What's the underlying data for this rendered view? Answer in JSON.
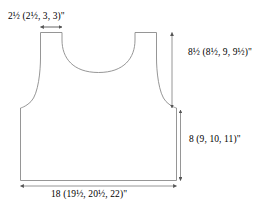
{
  "figure": {
    "type": "garment-schematic",
    "name": "Vest / tank top front piece schematic",
    "units": "inches",
    "size_convention": "smallest size first, remaining sizes in parentheses",
    "sizes": [
      "S",
      "M",
      "L",
      "XL"
    ],
    "colors": {
      "outline": "#8a8a8a",
      "dimension_line": "#8a8a8a",
      "text": "#000000",
      "background": "#ffffff"
    }
  },
  "labels": {
    "shoulder_width": {
      "id": "shoulder-width",
      "whole": "2",
      "frac_num": "1",
      "frac_den": "2",
      "parenthetical": "(2½, 3, 3)\"",
      "text": "2½ (2½, 3, 3)\"",
      "values": [
        "2½",
        "2½",
        "3",
        "3"
      ],
      "numeric_values": [
        2.5,
        2.5,
        3,
        3
      ],
      "position": "top-left",
      "measures": "shoulder strap width"
    },
    "armhole_depth": {
      "id": "armhole-depth",
      "text": "8½ (8½, 9, 9½)\"",
      "values": [
        "8½",
        "8½",
        "9",
        "9½"
      ],
      "numeric_values": [
        8.5,
        8.5,
        9,
        9.5
      ],
      "position": "right-upper",
      "measures": "shoulder to underarm depth"
    },
    "body_length": {
      "id": "body-length",
      "text": "8 (9, 10, 11)\"",
      "values": [
        "8",
        "9",
        "10",
        "11"
      ],
      "numeric_values": [
        8,
        9,
        10,
        11
      ],
      "position": "right-lower",
      "measures": "underarm to hem length"
    },
    "body_width": {
      "id": "body-width",
      "text": "18 (19½, 20½, 22)\"",
      "values": [
        "18",
        "19½",
        "20½",
        "22"
      ],
      "numeric_values": [
        18,
        19.5,
        20.5,
        22
      ],
      "position": "bottom",
      "measures": "bottom hem width"
    }
  }
}
